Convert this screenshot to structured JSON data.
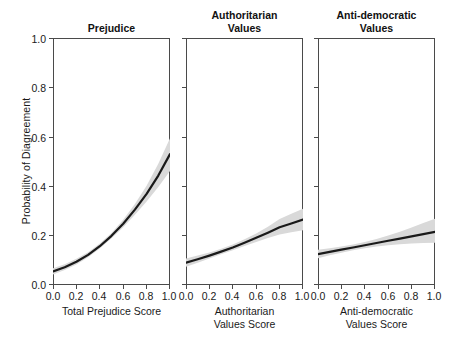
{
  "figure": {
    "ylabel": "Probability of Diagreement",
    "background_color": "#ffffff",
    "line_color": "#1a1a1a",
    "band_color": "#d9d9d9",
    "axis_color": "#4a4a4a"
  },
  "chart_data": [
    {
      "type": "line",
      "title": "Prejudice",
      "xlabel": "Total Prejudice Score",
      "ylabel": "Probability of Diagreement",
      "xlim": [
        0.0,
        1.0
      ],
      "ylim": [
        0.0,
        1.0
      ],
      "grid": false,
      "legend": "none",
      "xticks": [
        "0.0",
        "0.2",
        "0.4",
        "0.6",
        "0.8",
        "1.0"
      ],
      "yticks": [
        "0.0",
        "0.2",
        "0.4",
        "0.6",
        "0.8",
        "1.0"
      ],
      "x": [
        0.0,
        0.1,
        0.2,
        0.3,
        0.4,
        0.5,
        0.6,
        0.7,
        0.8,
        0.9,
        1.0
      ],
      "values": [
        0.055,
        0.072,
        0.094,
        0.122,
        0.157,
        0.199,
        0.248,
        0.305,
        0.369,
        0.443,
        0.53
      ],
      "ci_lower": [
        0.043,
        0.061,
        0.083,
        0.112,
        0.148,
        0.189,
        0.234,
        0.284,
        0.338,
        0.397,
        0.462
      ],
      "ci_upper": [
        0.068,
        0.084,
        0.106,
        0.133,
        0.168,
        0.211,
        0.264,
        0.328,
        0.402,
        0.491,
        0.594
      ]
    },
    {
      "type": "line",
      "title": "Authoritarian Values",
      "title_lines": [
        "Authoritarian",
        "Values"
      ],
      "xlabel": "Authoritarian Values Score",
      "xlabel_lines": [
        "Authoritarian",
        "Values Score"
      ],
      "ylabel": "Probability of Diagreement",
      "xlim": [
        0.0,
        1.0
      ],
      "ylim": [
        0.0,
        1.0
      ],
      "grid": false,
      "legend": "none",
      "xticks": [
        "0.0",
        "0.2",
        "0.4",
        "0.6",
        "0.8",
        "1.0"
      ],
      "yticks": [
        "0.0",
        "0.2",
        "0.4",
        "0.6",
        "0.8",
        "1.0"
      ],
      "x": [
        0.0,
        0.1,
        0.2,
        0.3,
        0.4,
        0.5,
        0.6,
        0.7,
        0.8,
        0.9,
        1.0
      ],
      "values": [
        0.09,
        0.104,
        0.119,
        0.135,
        0.152,
        0.171,
        0.191,
        0.212,
        0.234,
        0.249,
        0.265
      ],
      "ci_lower": [
        0.074,
        0.09,
        0.107,
        0.124,
        0.141,
        0.158,
        0.174,
        0.19,
        0.204,
        0.214,
        0.222
      ],
      "ci_upper": [
        0.107,
        0.119,
        0.132,
        0.147,
        0.164,
        0.185,
        0.209,
        0.236,
        0.267,
        0.288,
        0.309
      ]
    },
    {
      "type": "line",
      "title": "Anti-democratic Values",
      "title_lines": [
        "Anti-democratic",
        "Values"
      ],
      "xlabel": "Anti-democratic Values Score",
      "xlabel_lines": [
        "Anti-democratic",
        "Values Score"
      ],
      "ylabel": "Probability of Diagreement",
      "xlim": [
        0.0,
        1.0
      ],
      "ylim": [
        0.0,
        1.0
      ],
      "grid": false,
      "legend": "none",
      "xticks": [
        "0.0",
        "0.2",
        "0.4",
        "0.6",
        "0.8",
        "1.0"
      ],
      "yticks": [
        "0.0",
        "0.2",
        "0.4",
        "0.6",
        "0.8",
        "1.0"
      ],
      "x": [
        0.0,
        0.1,
        0.2,
        0.3,
        0.4,
        0.5,
        0.6,
        0.7,
        0.8,
        0.9,
        1.0
      ],
      "values": [
        0.125,
        0.134,
        0.143,
        0.152,
        0.161,
        0.17,
        0.179,
        0.188,
        0.197,
        0.206,
        0.215
      ],
      "ci_lower": [
        0.108,
        0.12,
        0.131,
        0.141,
        0.149,
        0.156,
        0.161,
        0.165,
        0.168,
        0.17,
        0.171
      ],
      "ci_upper": [
        0.143,
        0.149,
        0.156,
        0.164,
        0.174,
        0.186,
        0.2,
        0.216,
        0.233,
        0.251,
        0.268
      ]
    }
  ]
}
